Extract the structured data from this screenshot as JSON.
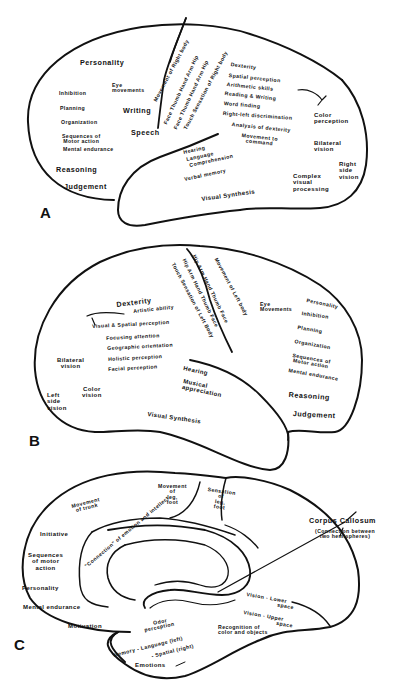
{
  "colors": {
    "ink": "#111111",
    "background": "#ffffff"
  },
  "panelA": {
    "letter": "A",
    "labels": {
      "personality": "Personality",
      "inhibition": "Inhibition",
      "planning": "Planning",
      "organization": "Organization",
      "sequences1": "Sequences of",
      "sequences2": "Motor action",
      "mental_endurance": "Mental endurance",
      "reasoning": "Reasoning",
      "judgement": "Judgement",
      "eye1": "Eye",
      "eye2": "movements",
      "writing": "Writing",
      "speech": "Speech",
      "movement_right_body": "Movement of Right body",
      "hand_arm_hip_motor": "Face   Thumb   Hand   Arm   Hip",
      "hand_arm_hip_touch": "Face   Thumb   Hand   Arm   Hip",
      "touch_right_body": "Touch Sensation of Right body",
      "dexterity": "Dexterity",
      "spatial_perception": "Spatial perception",
      "arithmetic": "Arithmetic skills",
      "reading_writing": "Reading & Writing",
      "word_finding": "Word finding",
      "right_left": "Right-left discrimination",
      "analysis_dexterity": "Analysis of dexterity",
      "movement_command1": "Movement to",
      "movement_command2": "command",
      "color1": "Color",
      "color2": "perception",
      "bilateral1": "Bilateral",
      "bilateral2": "vision",
      "right_side1": "Right",
      "right_side2": "side",
      "right_side3": "vision",
      "hearing": "Hearing",
      "language": "Language",
      "comprehension": "Comprehension",
      "verbal_memory": "Verbal memory",
      "visual_synthesis": "Visual Synthesis",
      "complex1": "Complex",
      "complex2": "visual",
      "complex3": "processing"
    }
  },
  "panelB": {
    "letter": "B",
    "labels": {
      "hip_arm_motor": "Hip   Arm   Hand   Thumb   Face",
      "movement_left_body": "Movement of Left body",
      "hip_arm_touch": "Hip   Arm   Hand   Thumb   Face",
      "touch_left_body": "Touch Sensation of Left Body",
      "dexterity": "Dexterity",
      "artistic": "Artistic ability",
      "visual_spatial": "Visual & Spatial perception",
      "focusing": "Focusing attention",
      "geographic": "Geographic orientation",
      "holistic": "Holistic perception",
      "facial": "Facial perception",
      "bilateral1": "Bilateral",
      "bilateral2": "vision",
      "color1": "Color",
      "color2": "vision",
      "left_side1": "Left",
      "left_side2": "side",
      "left_side3": "vision",
      "eye1": "Eye",
      "eye2": "Movements",
      "personality": "Personality",
      "inhibition": "Inhibition",
      "planning": "Planning",
      "organization": "Organization",
      "sequences1": "Sequences of",
      "sequences2": "Motor action",
      "mental_endurance": "Mental endurance",
      "reasoning": "Reasoning",
      "judgement": "Judgement",
      "hearing": "Hearing",
      "musical1": "Musical",
      "musical2": "appreciation",
      "visual_synthesis": "Visual Synthesis"
    }
  },
  "panelC": {
    "letter": "C",
    "labels": {
      "movement_trunk1": "Movement",
      "movement_trunk2": "of trunk",
      "movement_leg1": "Movement",
      "movement_leg2": "of",
      "movement_leg3": "leg,",
      "movement_leg4": "foot",
      "sensation_leg1": "Sensation",
      "sensation_leg2": "of",
      "sensation_leg3": "leg,",
      "sensation_leg4": "foot",
      "initiative": "Initiative",
      "connection": "\"Connection\" of emotion and intellect",
      "sequences1": "Sequences",
      "sequences2": "of motor",
      "sequences3": "action",
      "personality": "Personality",
      "mental_endurance": "Mental endurance",
      "motivation": "Motivation",
      "corpus_callosum": "Corpus Callosum",
      "corpus_sub1": "(Connection between",
      "corpus_sub2": "two hemispheres)",
      "vision_lower1": "Vision  -  Lower",
      "vision_lower2": "space",
      "vision_upper1": "Vision  -  Upper",
      "vision_upper2": "space",
      "odor1": "Odor",
      "odor2": "perception",
      "memory_language": "Memory  -  Language (left)",
      "memory_spatial": "-  Spatial (right)",
      "recognition1": "Recognition of",
      "recognition2": "color and objects",
      "emotions": "Emotions"
    }
  }
}
